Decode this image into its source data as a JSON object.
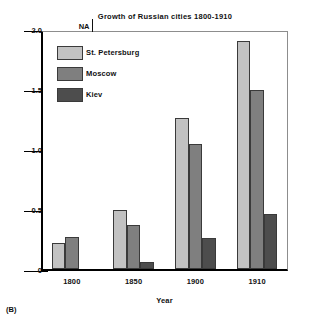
{
  "panel_label": "(B)",
  "legend": {
    "position": "top-left-inside",
    "entries": [
      {
        "label": "St. Petersburg",
        "color": "#c2c2c2"
      },
      {
        "label": "Moscow",
        "color": "#7f7f7f"
      },
      {
        "label": "Kiev",
        "color": "#4d4d4d"
      }
    ]
  },
  "annotations": [
    {
      "text": "NA",
      "series": "Kiev",
      "category": "1800"
    }
  ],
  "chart_data": {
    "type": "bar",
    "title": "Growth of Russian cities 1800-1910",
    "xlabel": "Year",
    "ylabel": "Total population (thousands)",
    "categories": [
      "1800",
      "1850",
      "1900",
      "1910"
    ],
    "ylim": [
      0,
      2.0
    ],
    "yticks": [
      "0",
      "0.5",
      "1.0",
      "1.5",
      "2.0"
    ],
    "ytick_values": [
      0,
      0.5,
      1.0,
      1.5,
      2.0
    ],
    "grid": false,
    "series": [
      {
        "name": "St. Petersburg",
        "color": "#c2c2c2",
        "values": [
          0.22,
          0.49,
          1.26,
          1.9
        ]
      },
      {
        "name": "Moscow",
        "color": "#7f7f7f",
        "values": [
          0.27,
          0.37,
          1.04,
          1.49
        ]
      },
      {
        "name": "Kiev",
        "color": "#4d4d4d",
        "values": [
          null,
          0.06,
          0.26,
          0.46
        ]
      }
    ]
  }
}
